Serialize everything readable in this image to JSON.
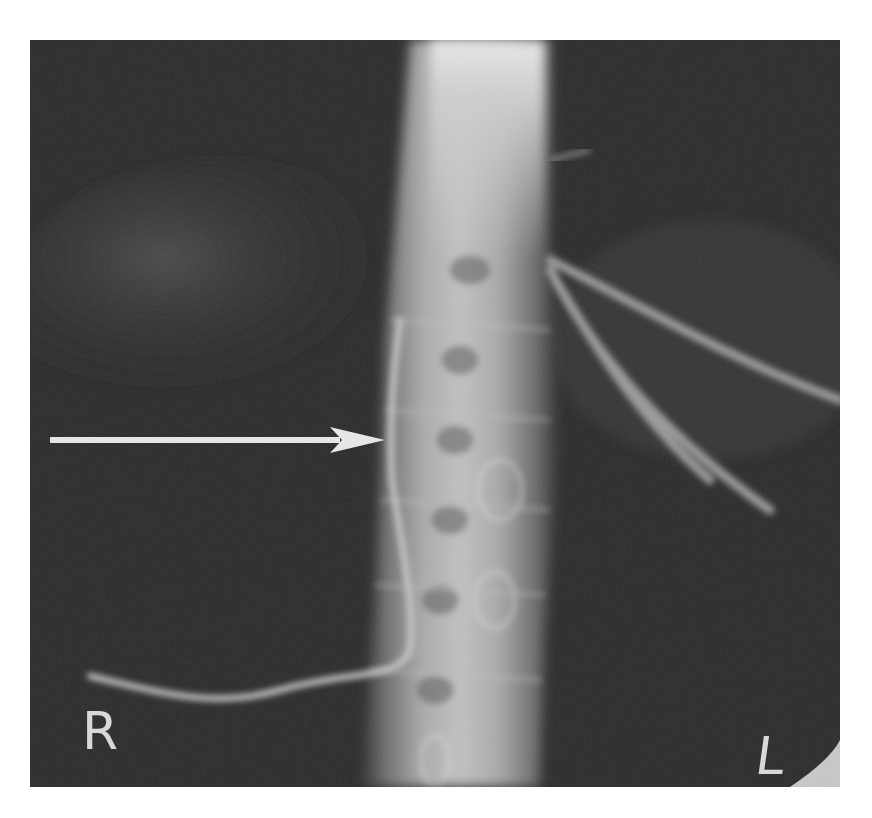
{
  "image": {
    "type": "radiograph",
    "description": "Frontal abdominal X-ray showing lumbar spine with catheters; white arrow points to a catheter running along the right side of the spine",
    "colors": {
      "background": "#ffffff",
      "film": "#2a2a2a",
      "bone": "#cfcfcf",
      "arrow": "#e6e6e6",
      "marker": "#d8d8d8"
    }
  },
  "markers": {
    "right": "R",
    "left": "L"
  },
  "annotation": {
    "arrow": {
      "direction": "right",
      "from": [
        50,
        440
      ],
      "to": [
        385,
        440
      ]
    }
  }
}
